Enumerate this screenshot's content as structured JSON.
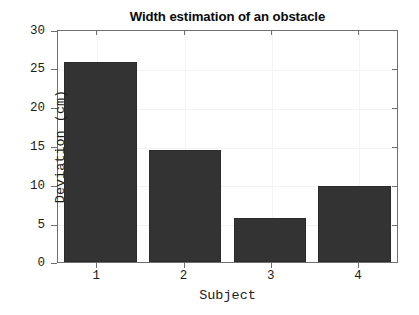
{
  "chart_data": {
    "type": "bar",
    "title": "Width estimation of an obstacle",
    "xlabel": "Subject",
    "ylabel": "Deviation (cm)",
    "categories": [
      "1",
      "2",
      "3",
      "4"
    ],
    "values": [
      26.0,
      14.6,
      5.7,
      9.9
    ],
    "ylim": [
      0,
      30
    ],
    "yticks": [
      0,
      5,
      10,
      15,
      20,
      25,
      30
    ],
    "ytick_labels": [
      "0",
      "5",
      "10",
      "15",
      "20",
      "25",
      "30"
    ],
    "xtick_labels": [
      "1",
      "2",
      "3",
      "4"
    ],
    "grid": true,
    "legend": null,
    "bar_color": "#333333",
    "axis_color": "#6f6f6f",
    "background_color": "#ffffff",
    "text_color": "#1c1c1c"
  }
}
